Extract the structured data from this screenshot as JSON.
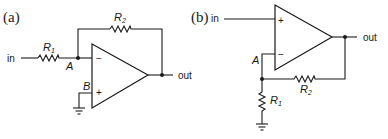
{
  "diagram": {
    "colors": {
      "ink": "#1a1a1a",
      "background": "#ffffff"
    },
    "circuit_a": {
      "panel_label": "(a)",
      "type": "inverting amplifier",
      "input_label": "in",
      "output_label": "out",
      "r1": {
        "letter": "R",
        "sub": "1"
      },
      "r2": {
        "letter": "R",
        "sub": "2"
      },
      "node_a": "A",
      "node_b": "B",
      "inverting_sign": "−",
      "noninverting_sign": "+"
    },
    "circuit_b": {
      "panel_label": "(b)",
      "type": "non-inverting amplifier",
      "input_label": "in",
      "output_label": "out",
      "r1": {
        "letter": "R",
        "sub": "1"
      },
      "r2": {
        "letter": "R",
        "sub": "2"
      },
      "node_a": "A",
      "inverting_sign": "−",
      "noninverting_sign": "+"
    }
  }
}
